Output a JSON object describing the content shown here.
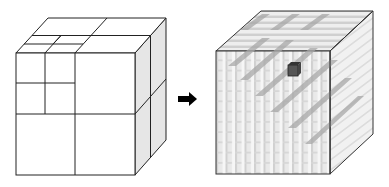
{
  "figure": {
    "left_cube": {
      "label": "adaptive subdivision cube",
      "levels": 2
    },
    "arrow": {
      "direction": "right"
    },
    "right_cube": {
      "label": "uniform voxel grid cube",
      "grid": 12,
      "highlighted_voxel": "dark cube near top center"
    }
  },
  "colors": {
    "line": "#222222",
    "side_face": "#e4e4e4",
    "voxel_light": "#eeeeee",
    "voxel_mid": "#c8c8c8",
    "voxel_dark": "#9a9a9a",
    "highlight": "#555555",
    "arrow": "#000000"
  }
}
